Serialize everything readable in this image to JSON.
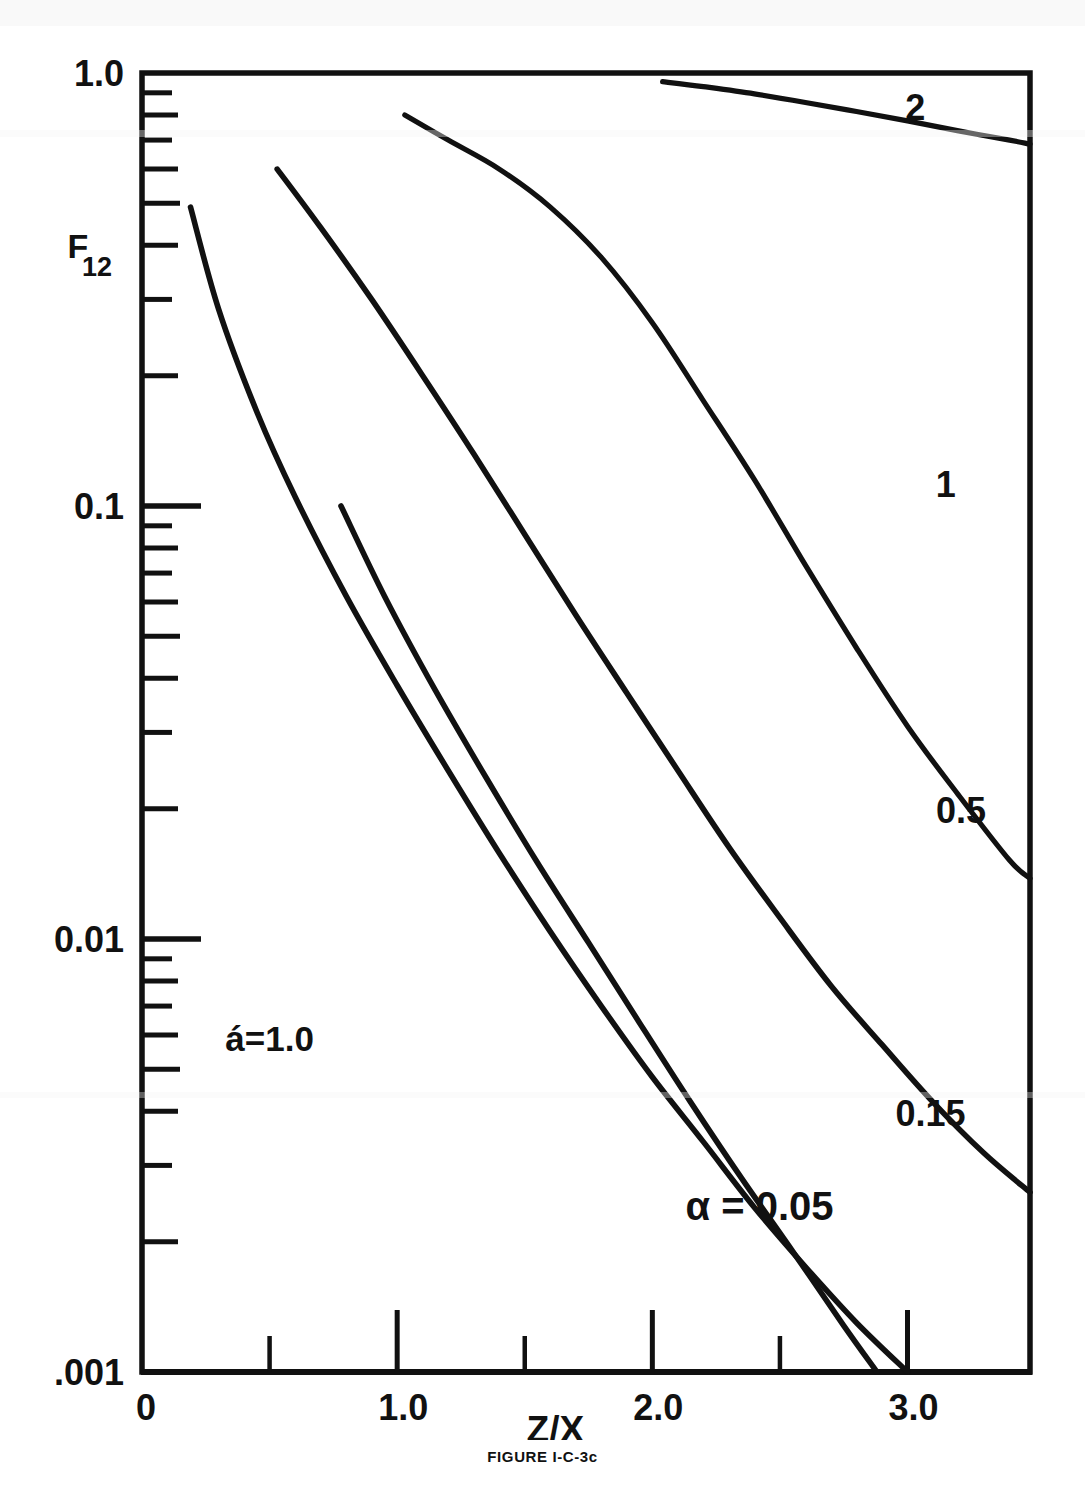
{
  "figure": {
    "caption": "FIGURE I-C-3c",
    "annotation_alpha_prime": "á=1.0",
    "annotation_alpha": "α = 0.05"
  },
  "chart_data": {
    "type": "line",
    "title": "",
    "xlabel": "Z/X",
    "ylabel": "F12",
    "ylabel_base": "F",
    "ylabel_sub": "12",
    "xscale": "linear",
    "yscale": "log",
    "xlim": [
      0,
      3.48
    ],
    "ylim": [
      0.001,
      1.0
    ],
    "grid": false,
    "legend_position": "inline-right",
    "x_ticks_major": [
      0,
      1.0,
      2.0,
      3.0
    ],
    "x_ticks_minor": [
      0.5,
      1.5,
      2.5
    ],
    "x_tick_labels": [
      "0",
      "1.0",
      "2.0",
      "3.0"
    ],
    "y_ticks_major": [
      1.0,
      0.1,
      0.01,
      0.001
    ],
    "y_tick_labels": [
      "1.0",
      "0.1",
      "0.01",
      ".001"
    ],
    "y_minor_per_decade": [
      2,
      3,
      4,
      5,
      6,
      7,
      8,
      9
    ],
    "series": [
      {
        "name": "2",
        "label": "2",
        "label_x": 3.03,
        "label_y": 0.78,
        "points": [
          [
            2.04,
            0.955
          ],
          [
            2.2,
            0.93
          ],
          [
            2.4,
            0.895
          ],
          [
            2.6,
            0.855
          ],
          [
            2.8,
            0.815
          ],
          [
            3.0,
            0.775
          ],
          [
            3.2,
            0.735
          ],
          [
            3.4,
            0.7
          ],
          [
            3.48,
            0.685
          ]
        ]
      },
      {
        "name": "1",
        "label": "1",
        "label_x": 3.15,
        "label_y": 0.105,
        "points": [
          [
            1.03,
            0.8
          ],
          [
            1.2,
            0.7
          ],
          [
            1.4,
            0.6
          ],
          [
            1.6,
            0.49
          ],
          [
            1.8,
            0.375
          ],
          [
            2.0,
            0.265
          ],
          [
            2.2,
            0.175
          ],
          [
            2.4,
            0.115
          ],
          [
            2.6,
            0.073
          ],
          [
            2.8,
            0.047
          ],
          [
            3.0,
            0.031
          ],
          [
            3.2,
            0.0215
          ],
          [
            3.4,
            0.0152
          ],
          [
            3.48,
            0.0138
          ]
        ]
      },
      {
        "name": "0.5",
        "label": "0.5",
        "label_x": 3.21,
        "label_y": 0.0185,
        "points": [
          [
            0.53,
            0.6
          ],
          [
            0.7,
            0.44
          ],
          [
            0.9,
            0.3
          ],
          [
            1.1,
            0.2
          ],
          [
            1.3,
            0.132
          ],
          [
            1.5,
            0.086
          ],
          [
            1.7,
            0.056
          ],
          [
            1.9,
            0.037
          ],
          [
            2.1,
            0.0245
          ],
          [
            2.3,
            0.0163
          ],
          [
            2.5,
            0.0112
          ],
          [
            2.7,
            0.0078
          ],
          [
            2.9,
            0.0057
          ],
          [
            3.1,
            0.0042
          ],
          [
            3.3,
            0.0032
          ],
          [
            3.48,
            0.0026
          ]
        ]
      },
      {
        "name": "0.15",
        "label": "0.15",
        "label_x": 3.09,
        "label_y": 0.0037,
        "points": [
          [
            0.19,
            0.49
          ],
          [
            0.3,
            0.285
          ],
          [
            0.45,
            0.165
          ],
          [
            0.6,
            0.105
          ],
          [
            0.8,
            0.062
          ],
          [
            1.0,
            0.0385
          ],
          [
            1.2,
            0.0245
          ],
          [
            1.4,
            0.0158
          ],
          [
            1.6,
            0.0104
          ],
          [
            1.8,
            0.007
          ],
          [
            2.0,
            0.0048
          ],
          [
            2.2,
            0.0034
          ],
          [
            2.4,
            0.0024
          ],
          [
            2.6,
            0.00175
          ],
          [
            2.8,
            0.0013
          ],
          [
            3.0,
            0.001
          ]
        ]
      },
      {
        "name": "0.05",
        "label": "α = 0.05",
        "label_x": 2.42,
        "label_y": 0.00225,
        "points": [
          [
            0.78,
            0.1
          ],
          [
            0.95,
            0.062
          ],
          [
            1.15,
            0.0375
          ],
          [
            1.35,
            0.0235
          ],
          [
            1.55,
            0.015
          ],
          [
            1.75,
            0.0098
          ],
          [
            1.95,
            0.0064
          ],
          [
            2.15,
            0.0042
          ],
          [
            2.35,
            0.0028
          ],
          [
            2.55,
            0.0019
          ],
          [
            2.75,
            0.00128
          ],
          [
            2.88,
            0.001
          ]
        ]
      }
    ]
  }
}
